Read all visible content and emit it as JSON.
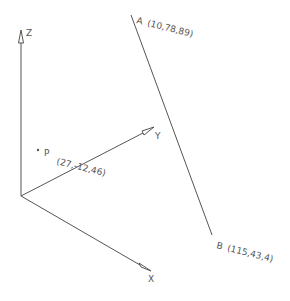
{
  "diagram": {
    "axes": {
      "z": {
        "label": "Z"
      },
      "y": {
        "label": "Y"
      },
      "x": {
        "label": "X"
      }
    },
    "points": {
      "A": {
        "label": "A",
        "coords": "(10,78,89)"
      },
      "B": {
        "label": "B",
        "coords": "(115,43,4)"
      },
      "P": {
        "label": "P",
        "coords": "(27,-12,46)"
      }
    },
    "colors": {
      "line": "#555555",
      "background": "#ffffff"
    }
  }
}
